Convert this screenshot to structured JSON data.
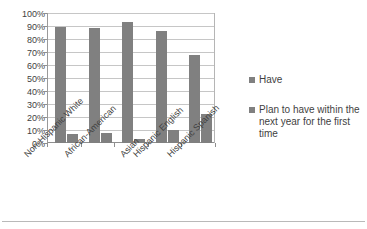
{
  "chart_data": {
    "type": "bar",
    "title": "",
    "subtitle": "",
    "xlabel": "",
    "ylabel": "",
    "ylim": [
      0,
      100
    ],
    "grid": true,
    "legend_position": "right",
    "categories": [
      "Non-Hispanic White",
      "African-American",
      "Asian",
      "Hispanic English",
      "Hispanic Spanish"
    ],
    "ytick_labels": [
      "100%",
      "90%",
      "80%",
      "70%",
      "60%",
      "50%",
      "40%",
      "30%",
      "20%",
      "10%",
      "0%"
    ],
    "ytick_values": [
      100,
      90,
      80,
      70,
      60,
      50,
      40,
      30,
      20,
      10,
      0
    ],
    "series": [
      {
        "name": "Have",
        "color": "#808080",
        "values": [
          90,
          89,
          93.5,
          86.5,
          68.5
        ]
      },
      {
        "name": "Plan to have within the next year for the first time",
        "color": "#808080",
        "values": [
          7,
          7.5,
          3.5,
          10,
          22.5
        ]
      }
    ]
  },
  "legend": {
    "entries": [
      {
        "label": "Have"
      },
      {
        "label": "Plan to have within the next year for the first time"
      }
    ]
  }
}
